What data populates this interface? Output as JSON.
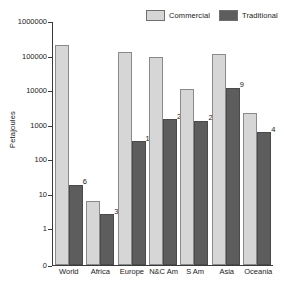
{
  "chart_data": {
    "type": "bar",
    "title": "",
    "xlabel": "",
    "ylabel": "Petajoules",
    "yscale": "log",
    "ylim": [
      1,
      1000000
    ],
    "ytick_labels": [
      "1000000",
      "100000",
      "10000",
      "1000",
      "100",
      "10",
      "1",
      "0"
    ],
    "ytick_values": [
      1000000,
      100000,
      10000,
      1000,
      100,
      10,
      1,
      0
    ],
    "grid": false,
    "legend_position": "top-right",
    "categories": [
      "World",
      "Africa",
      "Europe",
      "N&C Am",
      "S Am",
      "Asia",
      "Oceania"
    ],
    "series": [
      {
        "name": "Commercial",
        "color": "#d6d6d6",
        "values": [
          200000,
          6,
          130000,
          90000,
          11000,
          110000,
          2200
        ],
        "labels": [
          "",
          "",
          "",
          "",
          "",
          "",
          ""
        ]
      },
      {
        "name": "Traditional",
        "color": "#5d5d5d",
        "values": [
          18,
          2.5,
          330,
          1400,
          1300,
          11500,
          600
        ],
        "labels": [
          "6",
          "35",
          "1",
          "2",
          "21",
          "9",
          "4"
        ]
      }
    ],
    "annotations": [
      {
        "category": "World",
        "series": "Traditional",
        "text": "6"
      },
      {
        "category": "Africa",
        "series": "Traditional",
        "text": "35"
      },
      {
        "category": "Europe",
        "series": "Traditional",
        "text": "1"
      },
      {
        "category": "N&C Am",
        "series": "Traditional",
        "text": "2"
      },
      {
        "category": "S Am",
        "series": "Traditional",
        "text": "21"
      },
      {
        "category": "Asia",
        "series": "Traditional",
        "text": "9"
      },
      {
        "category": "Oceania",
        "series": "Traditional",
        "text": "4"
      }
    ]
  },
  "legend": {
    "items": [
      {
        "label": "Commercial",
        "color": "#d6d6d6"
      },
      {
        "label": "Traditional",
        "color": "#5d5d5d"
      }
    ]
  },
  "axis": {
    "y_title": "Petajoules"
  }
}
